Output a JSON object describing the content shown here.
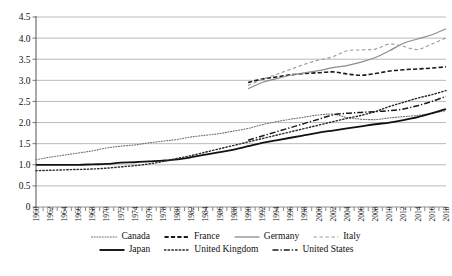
{
  "chart_data": {
    "type": "line",
    "title": "",
    "subtitle": "",
    "xlabel": "",
    "ylabel": "",
    "xlim": [
      1960,
      2018
    ],
    "ylim": [
      0,
      4.5
    ],
    "ytick_step": 0.5,
    "xtick_step": 2,
    "grid": "horizontal",
    "legend_position": "bottom",
    "yticks": [
      "0",
      "0.5",
      "1.0",
      "1.5",
      "2.0",
      "2.5",
      "3.0",
      "3.5",
      "4.0",
      "4.5"
    ],
    "xticks": [
      "1960",
      "1962",
      "1964",
      "1966",
      "1968",
      "1970",
      "1972",
      "1974",
      "1976",
      "1978",
      "1980",
      "1982",
      "1984",
      "1986",
      "1988",
      "1990",
      "1992",
      "1994",
      "1996",
      "1998",
      "2000",
      "2002",
      "2004",
      "2006",
      "2008",
      "2010",
      "2012",
      "2014",
      "2016",
      "2018"
    ],
    "series": [
      {
        "name": "Canada",
        "style": "dotted",
        "color": "#6f6f6f",
        "width": 1.1,
        "x": [
          1960,
          1962,
          1964,
          1966,
          1968,
          1970,
          1972,
          1974,
          1976,
          1978,
          1980,
          1982,
          1984,
          1986,
          1988,
          1990,
          1992,
          1994,
          1996,
          1998,
          2000,
          2002,
          2004,
          2006,
          2008,
          2010,
          2012,
          2014,
          2016,
          2018
        ],
        "values": [
          1.12,
          1.18,
          1.23,
          1.28,
          1.33,
          1.4,
          1.44,
          1.47,
          1.52,
          1.56,
          1.6,
          1.66,
          1.7,
          1.74,
          1.8,
          1.86,
          1.95,
          2.02,
          2.08,
          2.13,
          2.18,
          2.2,
          2.12,
          2.08,
          2.07,
          2.11,
          2.14,
          2.17,
          2.22,
          2.28
        ]
      },
      {
        "name": "France",
        "style": "dashed",
        "color": "#1a1a1a",
        "width": 1.6,
        "x": [
          1990,
          1992,
          1994,
          1996,
          1998,
          2000,
          2002,
          2004,
          2006,
          2008,
          2010,
          2012,
          2014,
          2016,
          2018
        ],
        "values": [
          2.95,
          3.03,
          3.08,
          3.13,
          3.16,
          3.18,
          3.2,
          3.15,
          3.12,
          3.16,
          3.22,
          3.25,
          3.27,
          3.29,
          3.32
        ]
      },
      {
        "name": "Germany",
        "style": "solid",
        "color": "#8c8c8c",
        "width": 1.2,
        "x": [
          1990,
          1992,
          1994,
          1996,
          1998,
          2000,
          2002,
          2004,
          2006,
          2008,
          2010,
          2012,
          2014,
          2016,
          2018
        ],
        "values": [
          2.8,
          2.95,
          3.04,
          3.12,
          3.18,
          3.23,
          3.3,
          3.35,
          3.43,
          3.54,
          3.7,
          3.88,
          3.98,
          4.08,
          4.22
        ]
      },
      {
        "name": "Italy",
        "style": "dashed-light",
        "color": "#9a9a9a",
        "width": 1.1,
        "x": [
          1990,
          1992,
          1994,
          1996,
          1998,
          2000,
          2002,
          2004,
          2006,
          2008,
          2010,
          2012,
          2014,
          2016,
          2018
        ],
        "values": [
          2.88,
          3.02,
          3.14,
          3.26,
          3.38,
          3.48,
          3.56,
          3.7,
          3.72,
          3.74,
          3.86,
          3.8,
          3.73,
          3.86,
          4.0
        ]
      },
      {
        "name": "Japan",
        "style": "solid",
        "color": "#111111",
        "width": 1.8,
        "x": [
          1960,
          1962,
          1964,
          1966,
          1968,
          1970,
          1972,
          1974,
          1976,
          1978,
          1980,
          1982,
          1984,
          1986,
          1988,
          1990,
          1992,
          1994,
          1996,
          1998,
          2000,
          2002,
          2004,
          2006,
          2008,
          2010,
          2012,
          2014,
          2016,
          2018
        ],
        "values": [
          1.0,
          1.0,
          1.0,
          1.0,
          1.01,
          1.02,
          1.05,
          1.06,
          1.08,
          1.1,
          1.13,
          1.18,
          1.24,
          1.3,
          1.36,
          1.44,
          1.52,
          1.58,
          1.64,
          1.7,
          1.76,
          1.81,
          1.86,
          1.91,
          1.96,
          2.0,
          2.06,
          2.13,
          2.22,
          2.32
        ]
      },
      {
        "name": "United Kingdom",
        "style": "dotted",
        "color": "#2a2a2a",
        "width": 1.4,
        "x": [
          1960,
          1962,
          1964,
          1966,
          1968,
          1970,
          1972,
          1974,
          1976,
          1978,
          1980,
          1982,
          1984,
          1986,
          1988,
          1990,
          1992,
          1994,
          1996,
          1998,
          2000,
          2002,
          2004,
          2006,
          2008,
          2010,
          2012,
          2014,
          2016,
          2018
        ],
        "values": [
          0.86,
          0.87,
          0.88,
          0.89,
          0.9,
          0.92,
          0.95,
          0.98,
          1.02,
          1.08,
          1.15,
          1.22,
          1.3,
          1.38,
          1.46,
          1.54,
          1.62,
          1.7,
          1.78,
          1.86,
          1.94,
          2.02,
          2.1,
          2.17,
          2.26,
          2.38,
          2.48,
          2.58,
          2.66,
          2.76
        ]
      },
      {
        "name": "United States",
        "style": "dashdot",
        "color": "#1a1a1a",
        "width": 1.5,
        "x": [
          1990,
          1992,
          1994,
          1996,
          1998,
          2000,
          2002,
          2004,
          2006,
          2008,
          2010,
          2012,
          2014,
          2016,
          2018
        ],
        "values": [
          1.58,
          1.68,
          1.78,
          1.88,
          1.98,
          2.08,
          2.18,
          2.22,
          2.24,
          2.26,
          2.28,
          2.32,
          2.4,
          2.5,
          2.62
        ]
      }
    ]
  },
  "legend": {
    "rows": [
      [
        {
          "label": "Canada",
          "style": "dotted",
          "color": "#6f6f6f",
          "width": 1.1
        },
        {
          "label": "France",
          "style": "dashed",
          "color": "#1a1a1a",
          "width": 1.9
        },
        {
          "label": "Germany",
          "style": "solid",
          "color": "#8c8c8c",
          "width": 1.3
        },
        {
          "label": "Italy",
          "style": "dashed-light",
          "color": "#9a9a9a",
          "width": 1.1
        }
      ],
      [
        {
          "label": "Japan",
          "style": "solid",
          "color": "#111111",
          "width": 1.9
        },
        {
          "label": "United Kingdom",
          "style": "dotted",
          "color": "#2a2a2a",
          "width": 1.5
        },
        {
          "label": "United States",
          "style": "dashdot",
          "color": "#1a1a1a",
          "width": 1.6
        }
      ]
    ]
  }
}
